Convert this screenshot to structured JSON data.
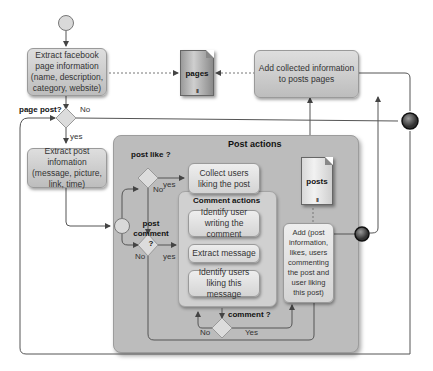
{
  "diagram": {
    "title": "Post actions",
    "nodes": {
      "extract_page_info": "Extract facebook page information (name, description, category, website)",
      "add_collected_info": "Add collected information to posts pages",
      "extract_post_info": "Extract post infomation (message, picture, link, time)",
      "collect_users_liking": "Collect users liking the post",
      "identify_user_writing": "Identify user writing the comment",
      "extract_message": "Extract message",
      "identify_users_liking_message": "Identify users liking this message",
      "add_post_info": "Add (post information, likes, users commenting the post and user liking this post)"
    },
    "data_stores": {
      "pages": "pages",
      "posts": "posts",
      "marker": "III"
    },
    "groups": {
      "post_actions": "Post actions",
      "comment_actions": "Comment actions"
    },
    "gateways": {
      "page_post": "page post?",
      "post_like": "post like ?",
      "post_comment": "post comment ?",
      "comment": "comment ?"
    },
    "edge_labels": {
      "page_post_no": "No",
      "page_post_yes": "yes",
      "post_like_yes": "yes",
      "post_like_no": "No",
      "post_comment_no": "No",
      "post_comment_yes": "yes",
      "comment_no": "No",
      "comment_yes": "Yes"
    },
    "colors": {
      "task_fill": "#cdcdcd",
      "pool_fill": "#bcbcbc",
      "line": "#555555",
      "start_event": "#d9d9d9",
      "end_event": "#4a4a4a"
    }
  }
}
